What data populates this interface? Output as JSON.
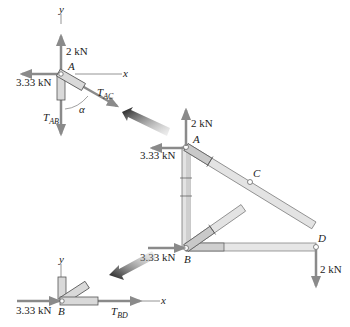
{
  "colors": {
    "force_arrow": "#8a8a8a",
    "member_fill": "#d9d9d9",
    "member_stroke": "#555555",
    "axis": "#7a7a7a",
    "text": "#222222",
    "pointer_dark": "#1a1a1a"
  },
  "fbd_A": {
    "axis_y": "y",
    "axis_x": "x",
    "joint": "A",
    "force_up": "2 kN",
    "force_left": "3.33 kN",
    "tension_ac": {
      "main": "T",
      "sub": "AC"
    },
    "tension_ab": {
      "main": "T",
      "sub": "AB"
    },
    "angle": "α"
  },
  "truss": {
    "joints": [
      "A",
      "B",
      "C",
      "D"
    ],
    "force_A_up": "2 kN",
    "force_A_left": "3.33 kN",
    "force_B_right": "3.33 kN",
    "force_D_down": "2 kN",
    "label_A": "A",
    "label_B": "B",
    "label_C": "C",
    "label_D": "D"
  },
  "fbd_B": {
    "axis_y": "y",
    "axis_x": "x",
    "joint": "B",
    "force_right": "3.33 kN",
    "tension_bd": {
      "main": "T",
      "sub": "BD"
    }
  },
  "pointers": [
    {
      "name": "pointer-to-fbd-A",
      "direction": "up-left"
    },
    {
      "name": "pointer-to-fbd-B",
      "direction": "down-left"
    }
  ]
}
